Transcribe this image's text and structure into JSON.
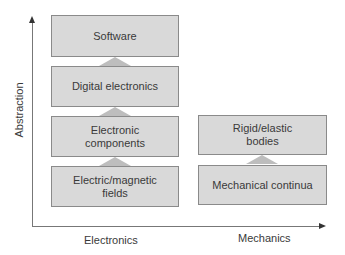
{
  "axes": {
    "y_label": "Abstraction",
    "x_categories": [
      "Electronics",
      "Mechanics"
    ]
  },
  "electronics_stack": [
    {
      "lines": [
        "Software"
      ]
    },
    {
      "lines": [
        "Digital electronics"
      ]
    },
    {
      "lines": [
        "Electronic",
        "components"
      ]
    },
    {
      "lines": [
        "Electric/magnetic",
        "fields"
      ]
    }
  ],
  "mechanics_stack": [
    {
      "lines": [
        "Rigid/elastic",
        "bodies"
      ]
    },
    {
      "lines": [
        "Mechanical continua"
      ]
    }
  ],
  "colors": {
    "box_fill": "#d9d9d9",
    "box_border": "#8a8a8a",
    "connector": "#bdbdbd",
    "axis": "#777777"
  }
}
